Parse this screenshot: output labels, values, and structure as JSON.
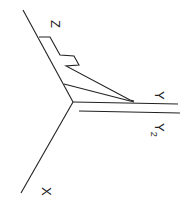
{
  "diagram": {
    "title": "",
    "axes": {
      "z_label": "Z",
      "y_label": "Y",
      "y2_label": "Y",
      "y2_subscript": "2",
      "x_label": "X"
    },
    "colors": {
      "line": "#222222",
      "background": "#ffffff"
    }
  }
}
